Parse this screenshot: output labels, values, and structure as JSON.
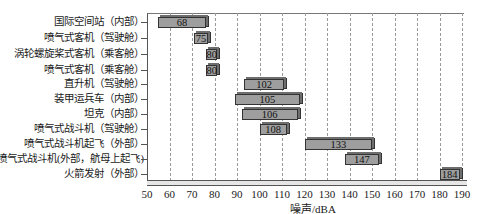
{
  "chart_data": {
    "type": "bar",
    "orientation": "horizontal-range",
    "title": "",
    "xlabel": "噪声/dBA",
    "ylabel": "",
    "xlim": [
      50,
      190
    ],
    "xticks": [
      50,
      60,
      70,
      80,
      90,
      100,
      110,
      120,
      130,
      140,
      150,
      160,
      170,
      180,
      190
    ],
    "grid": "vertical dashed",
    "categories": [
      "国际空间站（内部）",
      "喷气式客机（驾驶舱）",
      "涡轮螺旋桨式客机（乘客舱）",
      "喷气式客机（乘客舱）",
      "直升机（驾驶舱）",
      "装甲运兵车（内部）",
      "坦克（内部）",
      "喷气式战斗机（驾驶舱）",
      "喷气式战斗机起飞（外部）",
      "喷气式战斗机(外部，航母上起飞)",
      "火箭发射（外部）"
    ],
    "values": [
      68,
      75,
      80,
      80,
      102,
      105,
      106,
      108,
      133,
      147,
      184
    ],
    "ranges": [
      [
        55,
        76
      ],
      [
        71,
        77
      ],
      [
        76,
        81
      ],
      [
        76,
        81
      ],
      [
        93,
        111
      ],
      [
        89,
        118
      ],
      [
        92,
        117
      ],
      [
        100,
        112
      ],
      [
        120,
        150
      ],
      [
        138,
        153
      ],
      [
        180,
        189
      ]
    ]
  }
}
